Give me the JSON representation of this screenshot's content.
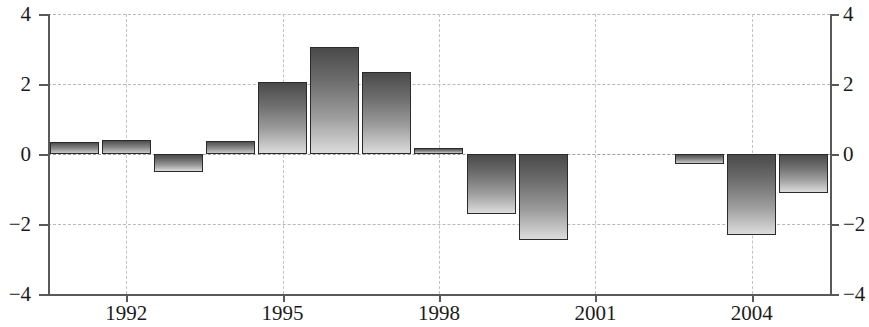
{
  "chart_data": {
    "type": "bar",
    "title": "",
    "subtitle": "",
    "xlabel": "",
    "ylabel": "",
    "ylim": [
      -4,
      4
    ],
    "xlim": [
      1990.5,
      2005.5
    ],
    "grid": true,
    "legend": null,
    "y_ticks": [
      4,
      2,
      0,
      -2,
      -4
    ],
    "y_tick_labels_left": [
      "4",
      "2",
      "0",
      "−2",
      "−4"
    ],
    "y_tick_labels_right": [
      "4",
      "2",
      "0",
      "−2",
      "−4"
    ],
    "x_ticks": [
      1992,
      1995,
      1998,
      2001,
      2004
    ],
    "x_tick_labels": [
      "1992",
      "1995",
      "1998",
      "2001",
      "2004"
    ],
    "categories": [
      "1991",
      "1992",
      "1993",
      "1994",
      "1995",
      "1996",
      "1997",
      "1998",
      "1999",
      "2000",
      "2001",
      "2002",
      "2003",
      "2004",
      "2005"
    ],
    "values": [
      0.35,
      0.4,
      -0.5,
      0.37,
      2.05,
      3.05,
      2.35,
      0.17,
      -1.72,
      -2.45,
      0.0,
      0.0,
      -0.28,
      -2.3,
      -1.1
    ],
    "bar_colors": {
      "edge": "#2a2a2a",
      "gradient_dark": "#4a4a4a",
      "gradient_light": "#dcdcdc"
    },
    "axis_color": "#59595b",
    "gridline_color": "#b9b9b9"
  }
}
